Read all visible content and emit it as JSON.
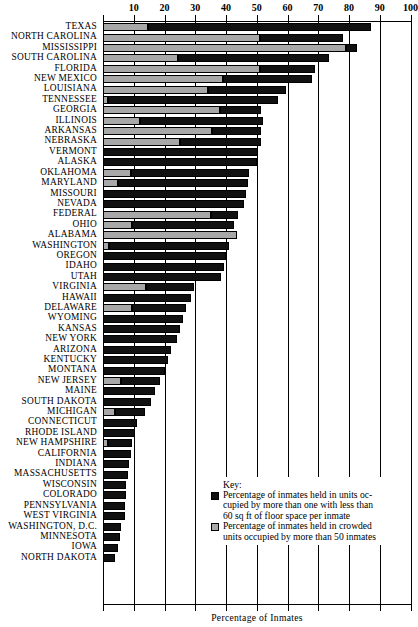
{
  "chart_data": {
    "type": "bar",
    "orientation": "horizontal",
    "stacked": true,
    "title": "",
    "xlabel": "Percentage of Inmates",
    "ylabel": "",
    "xlim": [
      0,
      100
    ],
    "xticks": [
      0,
      10,
      20,
      30,
      40,
      50,
      60,
      70,
      80,
      90,
      100
    ],
    "xtick_labels": [
      "",
      "10",
      "20",
      "30",
      "40",
      "50",
      "60",
      "70",
      "80",
      "90",
      "100"
    ],
    "grid": true,
    "legend_position": "bottom-right",
    "legend": {
      "title": "Key:",
      "entries": [
        {
          "name": "under-60-sqft",
          "color": "#111111",
          "label": "Percentage of inmates held in units occupied by more than one with less than 60 sq ft of floor space per inmate",
          "lines": [
            "Percentage of inmates held in units oc-",
            "cupied by more than one with less than",
            "60 sq ft of floor space per inmate"
          ]
        },
        {
          "name": "crowded-over-50-inmates",
          "color": "#a8a8a8",
          "label": "Percentage of inmates held in crowded units occupied by more than 50 inmates",
          "lines": [
            "Percentage of inmates held in crowded",
            "units occupied by more than 50 inmates"
          ]
        }
      ]
    },
    "categories": [
      "TEXAS",
      "NORTH CAROLINA",
      "MISSISSIPPI",
      "SOUTH CAROLINA",
      "FLORIDA",
      "NEW MEXICO",
      "LOUISIANA",
      "TENNESSEE",
      "GEORGIA",
      "ILLINOIS",
      "ARKANSAS",
      "NEBRASKA",
      "VERMONT",
      "ALASKA",
      "OKLAHOMA",
      "MARYLAND",
      "MISSOURI",
      "NEVADA",
      "FEDERAL",
      "OHIO",
      "ALABAMA",
      "WASHINGTON",
      "OREGON",
      "IDAHO",
      "UTAH",
      "VIRGINIA",
      "HAWAII",
      "DELAWARE",
      "WYOMING",
      "KANSAS",
      "NEW YORK",
      "ARIZONA",
      "KENTUCKY",
      "MONTANA",
      "NEW JERSEY",
      "MAINE",
      "SOUTH DAKOTA",
      "MICHIGAN",
      "CONNECTICUT",
      "RHODE ISLAND",
      "NEW HAMPSHIRE",
      "CALIFORNIA",
      "INDIANA",
      "MASSACHUSETTS",
      "WISCONSIN",
      "COLORADO",
      "PENNSYLVANIA",
      "WEST VIRGINIA",
      "WASHINGTON, D.C.",
      "MINNESOTA",
      "IOWA",
      "NORTH DAKOTA"
    ],
    "series": [
      {
        "name": "crowded-over-50-inmates",
        "color": "#a8a8a8",
        "values": [
          14.5,
          51.0,
          79.0,
          24.5,
          51.0,
          39.0,
          34.0,
          1.5,
          38.0,
          12.0,
          35.5,
          25.0,
          0.0,
          0.0,
          9.0,
          5.0,
          0.0,
          0.0,
          35.0,
          9.5,
          43.5,
          2.0,
          0.0,
          0.0,
          0.0,
          14.0,
          0.0,
          9.5,
          0.0,
          0.0,
          0.0,
          0.0,
          0.0,
          0.0,
          6.0,
          0.0,
          0.0,
          4.0,
          0.0,
          0.0,
          1.5,
          0.0,
          0.0,
          0.0,
          0.0,
          0.0,
          0.0,
          0.0,
          0.0,
          0.0,
          0.0,
          0.0
        ]
      },
      {
        "name": "under-60-sqft",
        "color": "#111111",
        "values": [
          72.5,
          27.0,
          3.5,
          49.0,
          18.0,
          29.0,
          25.5,
          55.5,
          13.5,
          40.0,
          16.0,
          26.5,
          50.5,
          50.0,
          38.5,
          42.0,
          46.5,
          46.0,
          9.0,
          33.0,
          0.0,
          39.0,
          40.0,
          39.5,
          38.5,
          15.5,
          28.5,
          17.5,
          26.0,
          25.0,
          24.0,
          22.0,
          21.0,
          20.0,
          12.5,
          17.0,
          15.5,
          9.5,
          11.0,
          10.5,
          8.0,
          9.0,
          8.5,
          8.0,
          7.5,
          7.5,
          7.0,
          7.0,
          6.0,
          5.5,
          5.0,
          4.0
        ]
      }
    ],
    "totals": [
      87.0,
      78.0,
      82.5,
      73.5,
      69.0,
      68.0,
      59.5,
      57.0,
      51.5,
      52.0,
      51.5,
      51.5,
      50.5,
      50.0,
      47.5,
      47.0,
      46.5,
      46.0,
      44.0,
      42.5,
      43.5,
      41.0,
      40.0,
      39.5,
      38.5,
      29.5,
      28.5,
      27.0,
      26.0,
      25.0,
      24.0,
      22.0,
      21.0,
      20.0,
      18.5,
      17.0,
      15.5,
      13.5,
      11.0,
      10.5,
      9.5,
      9.0,
      8.5,
      8.0,
      7.5,
      7.5,
      7.0,
      7.0,
      6.0,
      5.5,
      5.0,
      4.0
    ]
  }
}
